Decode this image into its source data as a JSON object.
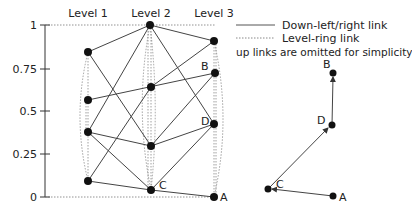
{
  "axis": {
    "ticks": [
      {
        "label": "1",
        "y": 25
      },
      {
        "label": "0.75",
        "y": 69
      },
      {
        "label": "0.5",
        "y": 111
      },
      {
        "label": "0.25",
        "y": 154
      },
      {
        "label": "0",
        "y": 197
      }
    ]
  },
  "levels": [
    {
      "label": "Level 1",
      "x": 88
    },
    {
      "label": "Level 2",
      "x": 151
    },
    {
      "label": "Level 3",
      "x": 214
    }
  ],
  "legend": {
    "solid": "Down-left/right link",
    "dotted": "Level-ring link",
    "note": "up links are omitted for simplicity"
  },
  "nodes": {
    "l2top": {
      "x": 150,
      "y": 25,
      "label": ""
    },
    "l3top": {
      "x": 214,
      "y": 41,
      "label": ""
    },
    "l1top": {
      "x": 88,
      "y": 52,
      "label": ""
    },
    "B": {
      "x": 215,
      "y": 73,
      "label": "B"
    },
    "l2mid": {
      "x": 151,
      "y": 87,
      "label": ""
    },
    "l1mid": {
      "x": 88,
      "y": 100,
      "label": ""
    },
    "D": {
      "x": 214,
      "y": 124,
      "label": "D"
    },
    "l1low": {
      "x": 88,
      "y": 132,
      "label": ""
    },
    "l2low": {
      "x": 151,
      "y": 146,
      "label": ""
    },
    "l1bot": {
      "x": 88,
      "y": 181,
      "label": ""
    },
    "C": {
      "x": 151,
      "y": 190,
      "label": "C"
    },
    "A": {
      "x": 214,
      "y": 197,
      "label": "A"
    }
  },
  "labels": {
    "B": "B",
    "C": "C",
    "D": "D",
    "A": "A"
  },
  "path_example": {
    "nodes": [
      "A",
      "C",
      "D",
      "B"
    ]
  }
}
